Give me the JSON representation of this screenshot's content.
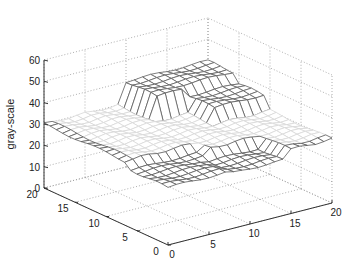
{
  "chart_data": {
    "type": "surface3d",
    "title": "",
    "xlabel": "",
    "ylabel": "",
    "zlabel": "gray-scale",
    "xlim": [
      0,
      20
    ],
    "ylim": [
      0,
      20
    ],
    "zlim": [
      0,
      60
    ],
    "x_ticks": [
      0,
      5,
      10,
      15,
      20
    ],
    "y_ticks": [
      0,
      5,
      10,
      15,
      20
    ],
    "z_ticks": [
      0,
      10,
      20,
      30,
      40,
      50,
      60
    ],
    "grid": true,
    "grid_style": "dotted",
    "surface_description": "Mesh approx 20x20; mostly flat plane near gray-scale 30, with a raised block (~40) at the back-right (x 10-20, y 15-20) and slight dip (~25-28) along front edge",
    "surface": {
      "nx": 21,
      "ny": 21,
      "base_level": 30,
      "regions": [
        {
          "x": [
            10,
            20
          ],
          "y": [
            15,
            20
          ],
          "z": 40
        },
        {
          "x": [
            14,
            20
          ],
          "y": [
            11,
            15
          ],
          "z": 36
        },
        {
          "x": [
            0,
            8
          ],
          "y": [
            0,
            6
          ],
          "z": 27
        },
        {
          "x": [
            8,
            14
          ],
          "y": [
            0,
            4
          ],
          "z": 26
        }
      ]
    },
    "colors": {
      "background": "#ffffff",
      "axis": "#333333",
      "grid": "#9a9a9a",
      "mesh_light": "#d8d8d8",
      "mesh_dark": "#5a5a5a"
    }
  },
  "labels": {
    "zlabel": "gray-scale"
  }
}
